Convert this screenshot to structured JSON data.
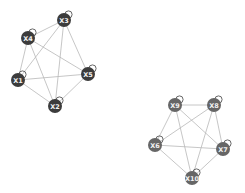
{
  "diagram": {
    "type": "network-graph",
    "clusters": [
      {
        "id": "cluster-1",
        "node_color": "#3c3c3c",
        "nodes": [
          {
            "id": "X1",
            "label": "X1",
            "x": 18,
            "y": 80
          },
          {
            "id": "X2",
            "label": "X2",
            "x": 55,
            "y": 106
          },
          {
            "id": "X3",
            "label": "X3",
            "x": 64,
            "y": 20
          },
          {
            "id": "X4",
            "label": "X4",
            "x": 28,
            "y": 38
          },
          {
            "id": "X5",
            "label": "X5",
            "x": 88,
            "y": 74
          }
        ],
        "edges": [
          [
            "X3",
            "X4"
          ],
          [
            "X3",
            "X1"
          ],
          [
            "X3",
            "X2"
          ],
          [
            "X3",
            "X5"
          ],
          [
            "X4",
            "X1"
          ],
          [
            "X4",
            "X2"
          ],
          [
            "X4",
            "X5"
          ],
          [
            "X1",
            "X5"
          ],
          [
            "X1",
            "X2"
          ],
          [
            "X2",
            "X5"
          ]
        ]
      },
      {
        "id": "cluster-2",
        "node_color": "#666666",
        "nodes": [
          {
            "id": "X6",
            "label": "X6",
            "x": 155,
            "y": 145
          },
          {
            "id": "X7",
            "label": "X7",
            "x": 223,
            "y": 149
          },
          {
            "id": "X8",
            "label": "X8",
            "x": 214,
            "y": 105
          },
          {
            "id": "X9",
            "label": "X9",
            "x": 175,
            "y": 105
          },
          {
            "id": "X10",
            "label": "X10",
            "x": 192,
            "y": 178
          }
        ],
        "edges": [
          [
            "X9",
            "X8"
          ],
          [
            "X9",
            "X6"
          ],
          [
            "X9",
            "X7"
          ],
          [
            "X9",
            "X10"
          ],
          [
            "X8",
            "X6"
          ],
          [
            "X8",
            "X7"
          ],
          [
            "X8",
            "X10"
          ],
          [
            "X6",
            "X7"
          ],
          [
            "X6",
            "X10"
          ],
          [
            "X7",
            "X10"
          ]
        ]
      }
    ],
    "self_loops": true,
    "edge_color": "#b8b8b8",
    "node_radius": 7
  }
}
